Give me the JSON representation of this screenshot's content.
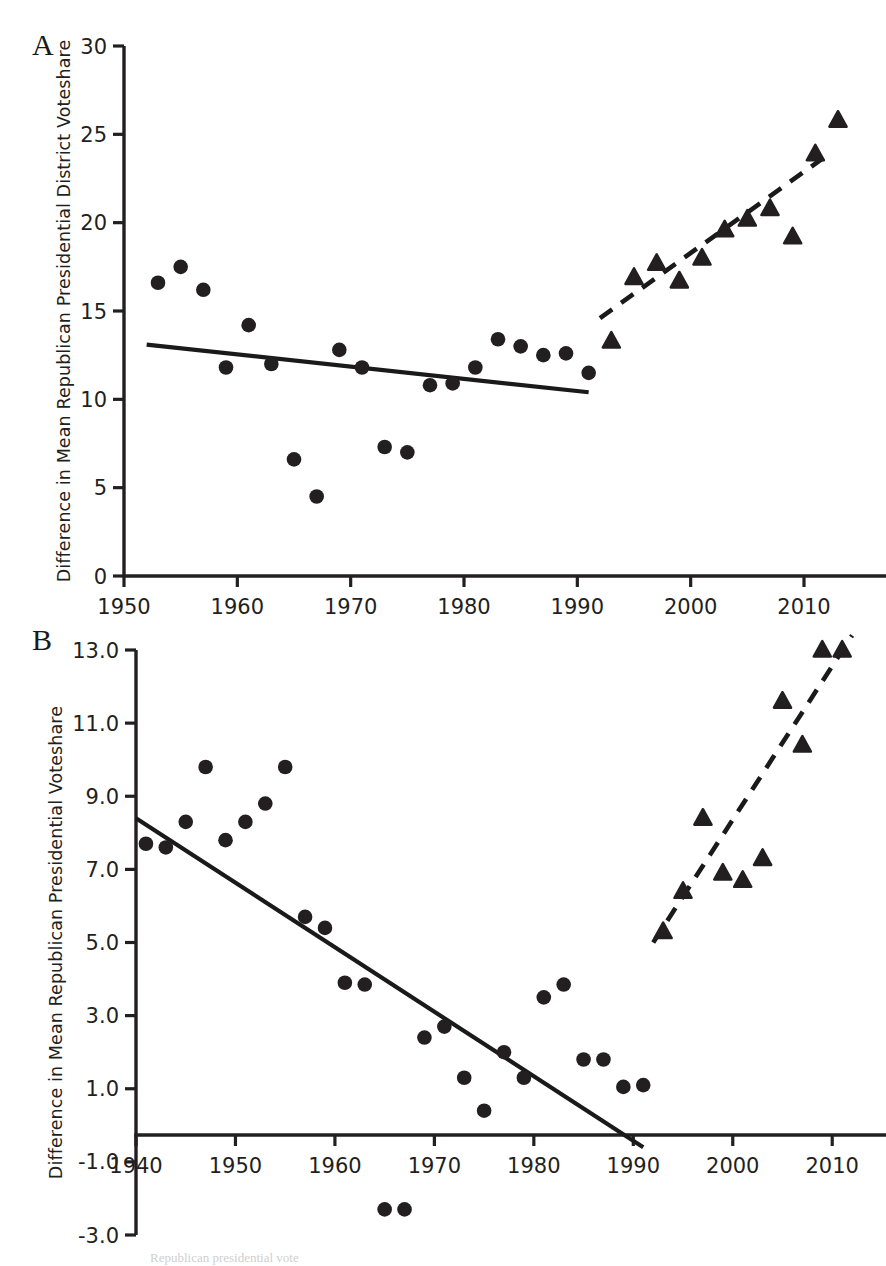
{
  "figure": {
    "background": "#ffffff",
    "marker_color": "#231f20",
    "width": 886,
    "height": 1262,
    "caption_fragment": "Republican presidential vote"
  },
  "panels": [
    {
      "id": "A",
      "label": "A"
    },
    {
      "id": "B",
      "label": "B"
    }
  ],
  "chart_data": [
    {
      "type": "scatter",
      "panel": "A",
      "title": "",
      "xlabel": "",
      "ylabel": "Difference in Mean Republican Presidential District Voteshare",
      "xlim": [
        1950,
        2016
      ],
      "ylim": [
        0,
        30
      ],
      "xticks": [
        1950,
        1960,
        1970,
        1980,
        1990,
        2000,
        2010
      ],
      "yticks": [
        0,
        5,
        10,
        15,
        20,
        25,
        30
      ],
      "xticklabels": [
        "1950",
        "1960",
        "1970",
        "1980",
        "1990",
        "2000",
        "2010"
      ],
      "yticklabels": [
        "0",
        "5",
        "10",
        "15",
        "20",
        "25",
        "30"
      ],
      "grid": false,
      "legend": "none",
      "series": [
        {
          "name": "Pre-1992 (circles)",
          "marker": "circle",
          "points": [
            [
              1953,
              16.6
            ],
            [
              1955,
              17.5
            ],
            [
              1957,
              16.2
            ],
            [
              1959,
              11.8
            ],
            [
              1961,
              14.2
            ],
            [
              1963,
              12.0
            ],
            [
              1965,
              6.6
            ],
            [
              1967,
              4.5
            ],
            [
              1969,
              12.8
            ],
            [
              1971,
              11.8
            ],
            [
              1973,
              7.3
            ],
            [
              1975,
              7.0
            ],
            [
              1977,
              10.8
            ],
            [
              1979,
              10.9
            ],
            [
              1981,
              11.8
            ],
            [
              1983,
              13.4
            ],
            [
              1985,
              13.0
            ],
            [
              1987,
              12.5
            ],
            [
              1989,
              12.6
            ],
            [
              1991,
              11.5
            ]
          ]
        },
        {
          "name": "Post-1992 (triangles)",
          "marker": "triangle",
          "points": [
            [
              1993,
              13.3
            ],
            [
              1995,
              16.9
            ],
            [
              1997,
              17.7
            ],
            [
              1999,
              16.7
            ],
            [
              2001,
              18.0
            ],
            [
              2003,
              19.6
            ],
            [
              2005,
              20.2
            ],
            [
              2007,
              20.8
            ],
            [
              2009,
              19.2
            ],
            [
              2011,
              23.9
            ],
            [
              2013,
              25.8
            ]
          ]
        }
      ],
      "trendlines": [
        {
          "name": "pre-1992 trend",
          "style": "solid",
          "x": [
            1952,
            1991
          ],
          "y": [
            13.1,
            10.4
          ]
        },
        {
          "name": "post-1992 trend",
          "style": "dashed",
          "x": [
            1992,
            2012
          ],
          "y": [
            14.6,
            23.8
          ]
        }
      ]
    },
    {
      "type": "scatter",
      "panel": "B",
      "title": "",
      "xlabel": "",
      "ylabel": "Difference in Mean Republican Presidential Voteshare",
      "xlim": [
        1940,
        2014
      ],
      "ylim": [
        -3.0,
        13.0
      ],
      "xticks": [
        1940,
        1950,
        1960,
        1970,
        1980,
        1990,
        2000,
        2010
      ],
      "yticks": [
        -3.0,
        -1.0,
        1.0,
        3.0,
        5.0,
        7.0,
        9.0,
        11.0,
        13.0
      ],
      "xticklabels": [
        "1940",
        "1950",
        "1960",
        "1970",
        "1980",
        "1990",
        "2000",
        "2010"
      ],
      "yticklabels": [
        "-3.0",
        "-1.0",
        "1.0",
        "3.0",
        "5.0",
        "7.0",
        "9.0",
        "11.0",
        "13.0"
      ],
      "grid": false,
      "legend": "none",
      "series": [
        {
          "name": "Pre-1992 (circles)",
          "marker": "circle",
          "points": [
            [
              1941,
              7.7
            ],
            [
              1943,
              7.6
            ],
            [
              1945,
              8.3
            ],
            [
              1947,
              9.8
            ],
            [
              1949,
              7.8
            ],
            [
              1951,
              8.3
            ],
            [
              1953,
              8.8
            ],
            [
              1955,
              9.8
            ],
            [
              1957,
              5.7
            ],
            [
              1959,
              5.4
            ],
            [
              1961,
              3.9
            ],
            [
              1963,
              3.85
            ],
            [
              1965,
              -2.3
            ],
            [
              1967,
              -2.3
            ],
            [
              1969,
              2.4
            ],
            [
              1971,
              2.7
            ],
            [
              1973,
              1.3
            ],
            [
              1975,
              0.4
            ],
            [
              1977,
              2.0
            ],
            [
              1979,
              1.3
            ],
            [
              1981,
              3.5
            ],
            [
              1983,
              3.85
            ],
            [
              1985,
              1.8
            ],
            [
              1987,
              1.8
            ],
            [
              1989,
              1.05
            ],
            [
              1991,
              1.1
            ]
          ]
        },
        {
          "name": "Post-1992 (triangles)",
          "marker": "triangle",
          "points": [
            [
              1993,
              5.3
            ],
            [
              1995,
              6.4
            ],
            [
              1997,
              8.4
            ],
            [
              1999,
              6.9
            ],
            [
              2001,
              6.7
            ],
            [
              2003,
              7.3
            ],
            [
              2005,
              11.6
            ],
            [
              2007,
              10.4
            ],
            [
              2009,
              13.0
            ],
            [
              2011,
              13.0
            ]
          ]
        }
      ],
      "trendlines": [
        {
          "name": "pre-1992 trend",
          "style": "solid",
          "x": [
            1940,
            1991
          ],
          "y": [
            8.4,
            -0.6
          ]
        },
        {
          "name": "post-1992 trend",
          "style": "dashed",
          "x": [
            1992,
            2012
          ],
          "y": [
            5.0,
            13.4
          ]
        }
      ]
    }
  ]
}
